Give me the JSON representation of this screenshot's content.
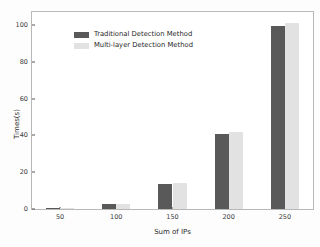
{
  "chart_data": {
    "type": "bar",
    "title": "",
    "xlabel": "Sum of IPs",
    "ylabel": "Times(s)",
    "categories": [
      "50",
      "100",
      "150",
      "200",
      "250"
    ],
    "series": [
      {
        "name": "Traditional Detection Method",
        "color": "#595959",
        "values": [
          0.3,
          2.8,
          13.5,
          41,
          99.5
        ]
      },
      {
        "name": "Multi-layer Detection Method",
        "color": "#e2e2e2",
        "values": [
          0.4,
          2.9,
          14,
          42,
          101
        ]
      }
    ],
    "yticks": [
      0,
      20,
      40,
      60,
      80,
      100
    ],
    "ylim": [
      0,
      107
    ],
    "xticklabels": [
      "50",
      "100",
      "150",
      "200",
      "250"
    ],
    "grid": false,
    "legend_position": "upper left"
  }
}
